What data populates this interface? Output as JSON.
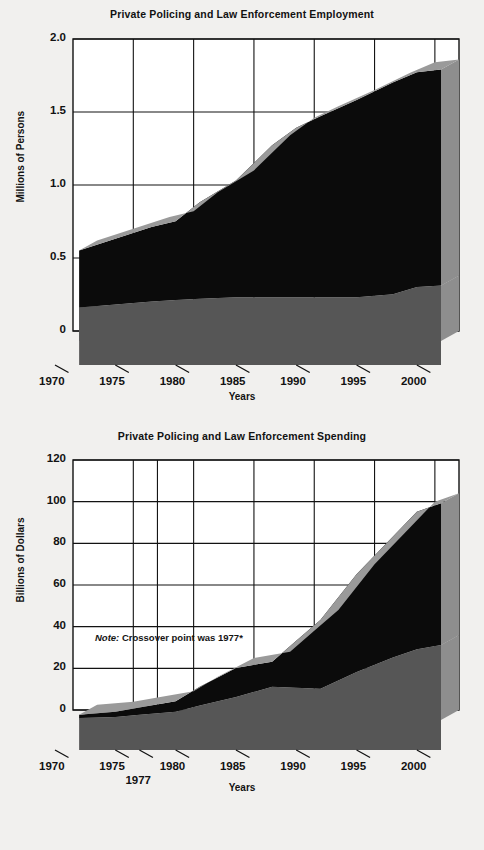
{
  "page": {
    "background_color": "#f1f0ee",
    "series_colors": {
      "private_fill": "#565656",
      "public_fill": "#0b0b0b",
      "top_highlight": "#9a9a9a",
      "side_shade": "#8e8e8e",
      "axis_color": "#121212"
    }
  },
  "chart_data": [
    {
      "id": "employment",
      "type": "area",
      "title": "Private Policing and Law Enforcement Employment",
      "xlabel": "Years",
      "ylabel": "Millions of Persons",
      "xlim": [
        1970,
        2002
      ],
      "ylim": [
        0,
        2.0
      ],
      "ytick_labels": [
        "2.0",
        "1.5",
        "1.0",
        "0.5",
        "0"
      ],
      "ytick_values": [
        2.0,
        1.5,
        1.0,
        0.5,
        0
      ],
      "xtick_labels": [
        "1970",
        "1975",
        "1980",
        "1985",
        "1990",
        "1995",
        "2000"
      ],
      "xtick_values": [
        1970,
        1975,
        1980,
        1985,
        1990,
        1995,
        2000
      ],
      "grid": true,
      "stacked": true,
      "legend": "none",
      "x": [
        1972,
        1975,
        1978,
        1980,
        1982,
        1985,
        1988,
        1990,
        1992,
        1995,
        1998,
        2000,
        2002
      ],
      "series": [
        {
          "name": "Public law enforcement employment",
          "color": "#565656",
          "values": [
            0.23,
            0.25,
            0.27,
            0.28,
            0.29,
            0.3,
            0.3,
            0.3,
            0.3,
            0.3,
            0.32,
            0.37,
            0.38
          ]
        },
        {
          "name": "Private policing employment",
          "color": "#0b0b0b",
          "values": [
            0.39,
            0.45,
            0.51,
            0.54,
            0.66,
            0.8,
            1.04,
            1.16,
            1.24,
            1.35,
            1.45,
            1.47,
            1.48
          ]
        }
      ],
      "totals": [
        0.62,
        0.7,
        0.78,
        0.82,
        0.95,
        1.1,
        1.34,
        1.46,
        1.54,
        1.65,
        1.77,
        1.84,
        1.86
      ]
    },
    {
      "id": "spending",
      "type": "area",
      "title": "Private Policing and Law Enforcement Spending",
      "xlabel": "Years",
      "ylabel": "Billions of Dollars",
      "xlim": [
        1970,
        2002
      ],
      "ylim": [
        0,
        120
      ],
      "ytick_labels": [
        "120",
        "100",
        "80",
        "60",
        "40",
        "20",
        "0"
      ],
      "ytick_values": [
        120,
        100,
        80,
        60,
        40,
        20,
        0
      ],
      "xtick_labels": [
        "1970",
        "1975",
        "1980",
        "1985",
        "1990",
        "1995",
        "2000"
      ],
      "xtick_values": [
        1970,
        1975,
        1980,
        1985,
        1990,
        1995,
        2000
      ],
      "extra_xtick_label": "1977",
      "extra_xtick_value": 1977,
      "grid": true,
      "stacked": true,
      "legend": "none",
      "note": "Crossover point was 1977*",
      "note_prefix": "Note:",
      "x": [
        1972,
        1975,
        1977,
        1980,
        1982,
        1985,
        1988,
        1990,
        1992,
        1995,
        1998,
        2000,
        2002
      ],
      "series": [
        {
          "name": "Public law enforcement spending",
          "color": "#565656",
          "values": [
            1.0,
            1.5,
            2.5,
            4.0,
            7.0,
            11.0,
            16.0,
            15.5,
            15.0,
            23.0,
            30.0,
            34.0,
            36.0
          ]
        },
        {
          "name": "Private policing spending",
          "color": "#0b0b0b",
          "values": [
            1.5,
            2.5,
            3.5,
            5.0,
            9.0,
            14.0,
            12.0,
            22.5,
            33.0,
            47.0,
            58.0,
            66.0,
            68.0
          ]
        }
      ],
      "totals": [
        2.5,
        4.0,
        6.0,
        9.0,
        16.0,
        25.0,
        28.0,
        38.0,
        48.0,
        70.0,
        88.0,
        100.0,
        104.0
      ]
    }
  ]
}
